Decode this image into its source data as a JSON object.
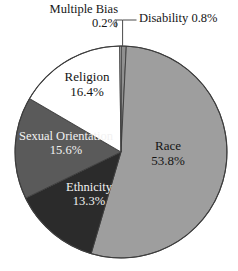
{
  "chart_data": {
    "type": "pie",
    "title": "",
    "subtitle": "",
    "xlabel": "",
    "ylabel": "",
    "legend_position": "none",
    "grid": false,
    "units": "percent",
    "start_angle_deg": 0,
    "direction": "clockwise",
    "categories": [
      "Disability",
      "Race",
      "Ethnicity",
      "Sexual Orientation",
      "Religion",
      "Multiple Bias"
    ],
    "values": [
      0.8,
      53.8,
      13.3,
      15.6,
      16.4,
      0.2
    ],
    "slices": [
      {
        "label": "Disability",
        "value": 0.8,
        "value_text": "0.8%",
        "display_text": "Disability 0.8%",
        "color": "#8f8f8f",
        "label_placement": "outside-leader",
        "text_color": "#161616"
      },
      {
        "label": "Race",
        "value": 53.8,
        "value_text": "53.8%",
        "display_text": "Race 53.8%",
        "color": "#9e9e9e",
        "label_placement": "inside",
        "text_color": "#151515"
      },
      {
        "label": "Ethnicity",
        "value": 13.3,
        "value_text": "13.3%",
        "display_text": "Ethnicity 13.3%",
        "color": "#2b2b2b",
        "label_placement": "inside",
        "text_color": "#f2f2f2"
      },
      {
        "label": "Sexual Orientation",
        "value": 15.6,
        "value_text": "15.6%",
        "display_text": "Sexual Orientation 15.6%",
        "color": "#5a5a5a",
        "label_placement": "inside",
        "text_color": "#f2f2f2"
      },
      {
        "label": "Religion",
        "value": 16.4,
        "value_text": "16.4%",
        "display_text": "Religion 16.4%",
        "color": "#ffffff",
        "label_placement": "inside",
        "text_color": "#141414"
      },
      {
        "label": "Multiple Bias",
        "value": 0.2,
        "value_text": "0.2%",
        "display_text": "Multiple Bias 0.2%",
        "color": "#fbfbfb",
        "label_placement": "outside-leader",
        "text_color": "#161616"
      }
    ],
    "colors": {
      "race": "#9e9e9e",
      "ethnicity": "#2b2b2b",
      "sexual_orientation": "#5a5a5a",
      "religion": "#ffffff",
      "disability": "#8f8f8f",
      "multiple_bias": "#fbfbfb",
      "outline": "#3d3d3d",
      "background": "#ffffff",
      "leader_line": "#4a4a4a"
    }
  },
  "labels": {
    "multiple_bias": {
      "name": "Multiple Bias",
      "pct": "0.2%"
    },
    "disability": {
      "text": "Disability 0.8%"
    },
    "religion": {
      "name": "Religion",
      "pct": "16.4%"
    },
    "sexual_orientation": {
      "name": "Sexual Orientation",
      "pct": "15.6%"
    },
    "ethnicity": {
      "name": "Ethnicity",
      "pct": "13.3%"
    },
    "race": {
      "name": "Race",
      "pct": "53.8%"
    }
  }
}
